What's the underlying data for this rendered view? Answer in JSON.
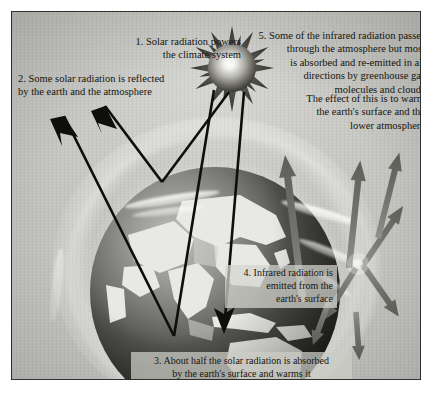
{
  "figure": {
    "style": "grayscale illustration with dark rectangular frame",
    "background_color": "#c9c9c6",
    "ink_color": "#15150f"
  },
  "annotations": [
    {
      "id": "note-1",
      "number": "1.",
      "align": "right",
      "lines": [
        "1. Solar radiation powers",
        "the climate system"
      ],
      "text": "1. Solar radiation powers the climate system"
    },
    {
      "id": "note-2",
      "number": "2.",
      "align": "left",
      "lines": [
        "2. Some solar radiation is reflected",
        "by the earth and the atmosphere"
      ],
      "text": "2. Some solar radiation is reflected by the earth and the atmosphere"
    },
    {
      "id": "note-3",
      "number": "3.",
      "align": "center",
      "boxed": true,
      "lines": [
        "3. About half the solar radiation is absorbed",
        "by the earth's surface and warms it"
      ],
      "text": "3. About half the solar radiation is absorbed by the earth's surface and warms it"
    },
    {
      "id": "note-4",
      "number": "4.",
      "align": "right",
      "boxed": true,
      "lines": [
        "4. Infrared radiation is",
        "emitted from the",
        "earth's surface"
      ],
      "text": "4. Infrared radiation is emitted from the earth's surface"
    },
    {
      "id": "note-5",
      "number": "5.",
      "align": "right",
      "lines": [
        "5. Some of the infrared radiation passes",
        "through the atmosphere but most",
        "is absorbed and re-emitted in all",
        "directions by greenhouse gas",
        "molecules and clouds"
      ],
      "text": "5. Some of the infrared radiation passes through the atmosphere but most is absorbed and re-emitted in all directions by greenhouse gas molecules and clouds"
    },
    {
      "id": "note-5b",
      "number": "",
      "align": "right",
      "lines": [
        "The effect of this is to warm",
        "the earth's surface and the",
        "lower atmosphere"
      ],
      "text": "The effect of this is to warm the earth's surface and the lower atmosphere"
    }
  ],
  "elements": {
    "sun": {
      "name": "sun",
      "ray_count": 12,
      "core_color": "#ffffff",
      "ray_color": "#3a3a38"
    },
    "earth": {
      "name": "earth-globe",
      "visible_regions": "Asia, Australia, Indonesia",
      "surface_color": "#e9e9e6",
      "ocean_color": "#3c3c3a"
    },
    "atmosphere": {
      "name": "atmosphere-halo",
      "color": "#ffffff"
    },
    "clouds": {
      "name": "cloud-streaks",
      "count": 6,
      "color": "#ffffff"
    },
    "solar_arrows": {
      "name": "solar-radiation-arrows",
      "color": "#111111",
      "count": 4,
      "description": "black arrows from sun, two reflected upward, one absorbed at surface"
    },
    "infrared_arrows": {
      "name": "infrared-radiation-arrows",
      "color": "#6f6f6b",
      "count": 8,
      "description": "grey arrows rising from earth's surface and re-emitted in all directions"
    },
    "scatter_node": {
      "name": "greenhouse-gas-scattering-node",
      "color": "#8a8a86",
      "spoke_count": 6
    }
  }
}
